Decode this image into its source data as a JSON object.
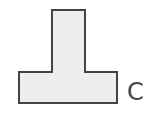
{
  "diagram": {
    "shape": {
      "type": "T-shaped polygon",
      "points": "52,10 85,10 85,72 117,72 117,103 19,103 19,72 52,72",
      "fill": "#eeeeee",
      "stroke": "#444444",
      "stroke_width": 2
    },
    "label": {
      "text": "C"
    }
  }
}
